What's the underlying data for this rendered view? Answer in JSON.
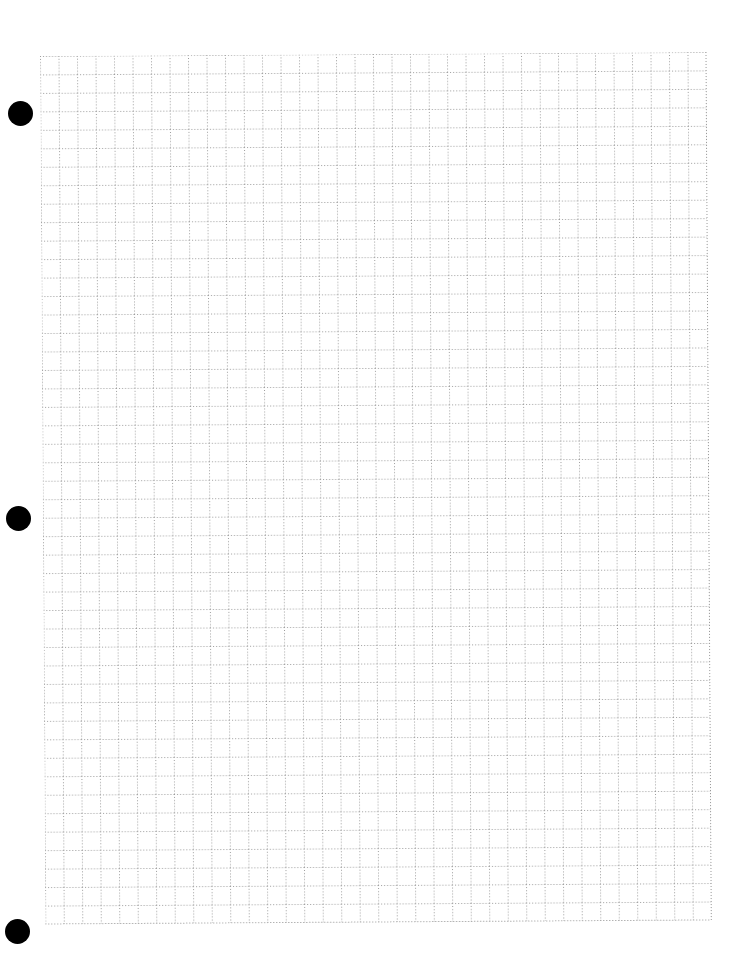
{
  "page": {
    "type": "graph paper sheet",
    "grid": {
      "columns": 36,
      "rows": 47,
      "line_style": "dotted",
      "line_color": "#a8a8a8"
    },
    "binder_holes": [
      {
        "position": "top",
        "color": "#000000"
      },
      {
        "position": "middle",
        "color": "#000000"
      },
      {
        "position": "bottom",
        "color": "#000000"
      }
    ],
    "background_color": "#ffffff"
  }
}
